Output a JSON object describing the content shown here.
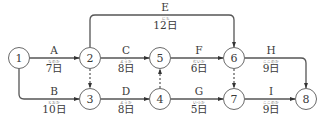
{
  "diagram": {
    "type": "arrow-network",
    "colors": {
      "line": "#555555",
      "node_stroke": "#6a6a6a",
      "text": "#3a3a3a"
    },
    "nodes": [
      {
        "id": "1",
        "label": "1",
        "x": 19,
        "y": 58
      },
      {
        "id": "2",
        "label": "2",
        "x": 90,
        "y": 58
      },
      {
        "id": "3",
        "label": "3",
        "x": 90,
        "y": 99
      },
      {
        "id": "4",
        "label": "4",
        "x": 160,
        "y": 99
      },
      {
        "id": "5",
        "label": "5",
        "x": 160,
        "y": 58
      },
      {
        "id": "6",
        "label": "6",
        "x": 234,
        "y": 58
      },
      {
        "id": "7",
        "label": "7",
        "x": 234,
        "y": 99
      },
      {
        "id": "8",
        "label": "8",
        "x": 306,
        "y": 99
      }
    ],
    "activities": [
      {
        "name": "A",
        "from": "1",
        "to": "2",
        "duration": "7日",
        "ruby": "なのか"
      },
      {
        "name": "B",
        "from": "1",
        "to": "3",
        "duration": "10日",
        "ruby": "とおか"
      },
      {
        "name": "C",
        "from": "2",
        "to": "5",
        "duration": "8日",
        "ruby": "ようか"
      },
      {
        "name": "D",
        "from": "3",
        "to": "4",
        "duration": "8日",
        "ruby": "ようか"
      },
      {
        "name": "E",
        "from": "2",
        "to": "6",
        "duration": "12日",
        "ruby": "にち"
      },
      {
        "name": "F",
        "from": "5",
        "to": "6",
        "duration": "6日",
        "ruby": "むいか"
      },
      {
        "name": "G",
        "from": "4",
        "to": "7",
        "duration": "5日",
        "ruby": "いつか"
      },
      {
        "name": "H",
        "from": "6",
        "to": "8",
        "duration": "9日",
        "ruby": "ここのか"
      },
      {
        "name": "I",
        "from": "7",
        "to": "8",
        "duration": "9日",
        "ruby": "ここのか"
      }
    ],
    "dummies": [
      {
        "from": "2",
        "to": "3"
      },
      {
        "from": "4",
        "to": "5"
      },
      {
        "from": "6",
        "to": "7"
      }
    ]
  }
}
